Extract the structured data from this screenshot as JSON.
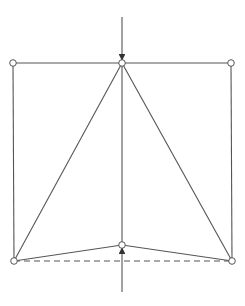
{
  "diagram": {
    "type": "truss",
    "colors": {
      "stroke": "#555555",
      "node_fill": "#ffffff",
      "background": "#ffffff"
    },
    "nodes": [
      {
        "id": "top-left",
        "x": 13,
        "y": 63
      },
      {
        "id": "top-center",
        "x": 122,
        "y": 63
      },
      {
        "id": "top-right",
        "x": 231,
        "y": 63
      },
      {
        "id": "bottom-left",
        "x": 14,
        "y": 261
      },
      {
        "id": "bottom-center",
        "x": 122,
        "y": 245
      },
      {
        "id": "bottom-right",
        "x": 232,
        "y": 261
      }
    ],
    "members": [
      {
        "from": "top-left",
        "to": "top-center",
        "style": "solid"
      },
      {
        "from": "top-center",
        "to": "top-right",
        "style": "solid"
      },
      {
        "from": "top-left",
        "to": "bottom-left",
        "style": "solid"
      },
      {
        "from": "top-right",
        "to": "bottom-right",
        "style": "solid"
      },
      {
        "from": "top-center",
        "to": "bottom-left",
        "style": "solid"
      },
      {
        "from": "top-center",
        "to": "bottom-right",
        "style": "solid"
      },
      {
        "from": "top-center",
        "to": "bottom-center",
        "style": "solid"
      },
      {
        "from": "bottom-left",
        "to": "bottom-center",
        "style": "solid"
      },
      {
        "from": "bottom-center",
        "to": "bottom-right",
        "style": "solid"
      },
      {
        "from": "bottom-left",
        "to": "bottom-right",
        "style": "dashed"
      }
    ],
    "loads": [
      {
        "id": "top-load",
        "at": "top-center",
        "direction": "down",
        "x1": 122,
        "y1": 17,
        "x2": 122,
        "y2": 60
      },
      {
        "id": "bottom-load",
        "at": "bottom-center",
        "direction": "up",
        "x1": 122,
        "y1": 292,
        "x2": 122,
        "y2": 248
      }
    ]
  }
}
